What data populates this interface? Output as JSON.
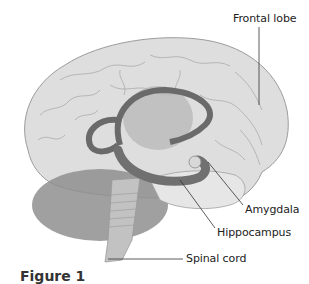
{
  "figure": {
    "caption_partial": "Figure 1",
    "colors": {
      "cortex": "#dcdcdc",
      "cortex_outline": "#9a9a9a",
      "gyri_lines": "#a8a8a8",
      "inner_structure": "#b8b8b8",
      "hippocampus": "#6e6e6e",
      "cerebellum": "#8e8e8e",
      "brainstem": "#bdbdbd",
      "leader_line": "#333333",
      "text": "#222222"
    }
  },
  "labels": {
    "frontal_lobe": "Frontal lobe",
    "amygdala": "Amygdala",
    "hippocampus": "Hippocampus",
    "spinal_cord": "Spinal cord"
  }
}
